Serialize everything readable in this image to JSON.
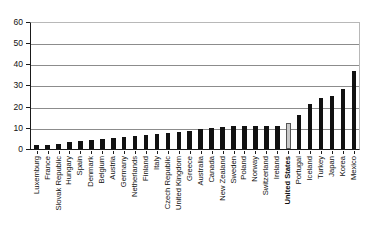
{
  "chart_data": {
    "type": "bar",
    "title": "",
    "subtitle": "",
    "xlabel": "",
    "ylabel": "",
    "ylim": [
      0,
      60
    ],
    "yticks": [
      0,
      10,
      20,
      30,
      40,
      50,
      60
    ],
    "grid": true,
    "legend": false,
    "highlight_category": "United States",
    "colors": {
      "bar": "#111111",
      "highlight_bar": "#c9c9c9",
      "gridline": "#8c8c8c",
      "axis": "#1a1a1a"
    },
    "categories": [
      "Luxemburg",
      "France",
      "Slovak Republic",
      "Hungary",
      "Spain",
      "Denmark",
      "Belgium",
      "Austria",
      "Germany",
      "Netherlands",
      "Finland",
      "Italy",
      "Czech Republic",
      "United Kingdom",
      "Greece",
      "Australia",
      "Canada",
      "New Zealand",
      "Sweden",
      "Poland",
      "Norway",
      "Switzerland",
      "Ireland",
      "United States",
      "Portugal",
      "Iceland",
      "Turkey",
      "Japan",
      "Korea",
      "Mexico"
    ],
    "values": [
      2,
      2,
      2.5,
      3,
      3.5,
      4,
      4.5,
      5,
      5.5,
      6,
      6.5,
      7,
      7.5,
      8,
      8.5,
      9.5,
      10,
      10.5,
      11,
      11,
      11,
      11,
      11,
      12,
      16,
      21,
      24,
      25,
      28.5,
      37
    ]
  }
}
